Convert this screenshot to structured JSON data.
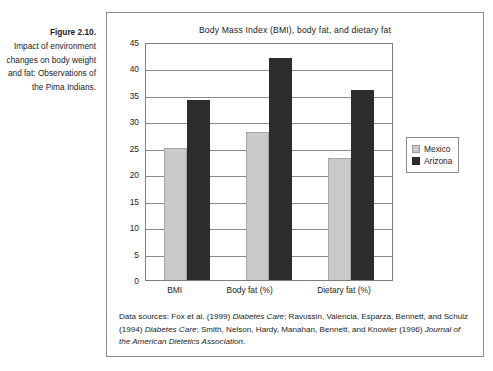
{
  "caption": {
    "figure_number": "Figure 2.10.",
    "text": "Impact of environment changes on body weight and fat: Observations of the Pima Indians."
  },
  "chart_data": {
    "type": "bar",
    "title": "Body Mass Index (BMI), body fat, and dietary fat",
    "xlabel": "",
    "ylabel": "",
    "categories": [
      "BMI",
      "Body fat (%)",
      "Dietary fat (%)"
    ],
    "series": [
      {
        "name": "Mexico",
        "color": "#c9c9c9",
        "values": [
          25,
          28,
          23
        ]
      },
      {
        "name": "Arizona",
        "color": "#2c2c2c",
        "values": [
          34,
          42,
          36
        ]
      }
    ],
    "ylim": [
      0,
      45
    ],
    "ytick_step": 5,
    "yticks": [
      45,
      40,
      35,
      30,
      25,
      20,
      15,
      10,
      5,
      0
    ],
    "grid": true,
    "legend_position": "right"
  },
  "source_note": {
    "lead": "Data sources:  Fox et al. (1999) ",
    "journal_1": "Diabetes Care",
    "mid_1": "; Ravussin, Valencia, Esparza, Bennett, and Schulz (1994) ",
    "journal_2": "Diabetes Care",
    "mid_2": "; Smith, Nelson, Hardy, Manahan, Bennett, and Knowler (1996) ",
    "journal_3": "Journal of the American Dietetics Association",
    "tail": "."
  }
}
